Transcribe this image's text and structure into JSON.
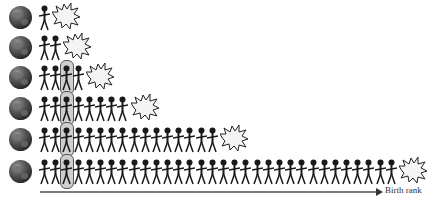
{
  "diagram": {
    "rows": [
      {
        "count": 1,
        "highlight_index": null
      },
      {
        "count": 2,
        "highlight_index": null
      },
      {
        "count": 4,
        "highlight_index": 2
      },
      {
        "count": 8,
        "highlight_index": 2
      },
      {
        "count": 16,
        "highlight_index": 2
      },
      {
        "count": 32,
        "highlight_index": 2
      }
    ],
    "row_icon": "globe-icon",
    "figure_icon": "person-icon",
    "end_icon": "explosion-icon",
    "axis_label": "Birth rank",
    "colors": {
      "figure": "#1a1a1a",
      "highlight": "#cfcfcf",
      "axis": "#7a7a7a"
    }
  }
}
